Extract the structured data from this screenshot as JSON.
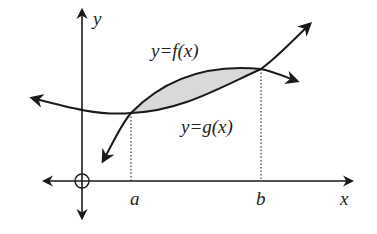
{
  "diagram": {
    "labels": {
      "y_axis": "y",
      "x_axis": "x",
      "point_a": "a",
      "point_b": "b",
      "upper_curve": "y=f(x)",
      "lower_curve": "y=g(x)"
    },
    "colors": {
      "stroke": "#1a1a1a",
      "shaded_region": "#d9d9d9",
      "background": "#ffffff"
    }
  }
}
